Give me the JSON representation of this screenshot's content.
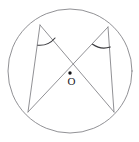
{
  "figure": {
    "type": "geometry-diagram",
    "canvas": {
      "width": 139,
      "height": 142,
      "background": "#ffffff"
    },
    "colors": {
      "line": "#7d7d82",
      "angle_arc": "#3a3a3e",
      "center_dot": "#111114",
      "label": "#1b1b1f"
    },
    "circle": {
      "name": "main-circle",
      "center": {
        "x": 70,
        "y": 71
      },
      "radius": 62,
      "stroke": "#7d7d82",
      "stroke_width": 0.85
    },
    "center_point": {
      "label": "O",
      "dot": {
        "x": 70,
        "y": 73,
        "r": 1.7
      },
      "label_position": {
        "x": 71.5,
        "y": 82
      }
    },
    "vertices": [
      {
        "id": "A",
        "role": "top-left",
        "x": 40,
        "y": 25
      },
      {
        "id": "B",
        "role": "top-right",
        "x": 108,
        "y": 27
      },
      {
        "id": "C",
        "role": "bottom-left",
        "x": 28,
        "y": 112
      },
      {
        "id": "D",
        "role": "bottom-right",
        "x": 114,
        "y": 112
      }
    ],
    "segments": [
      {
        "id": "A-D",
        "name": "chord-top-left-to-bottom-right",
        "from": "A",
        "to": "D"
      },
      {
        "id": "B-C",
        "name": "chord-top-right-to-bottom-left",
        "from": "B",
        "to": "C"
      },
      {
        "id": "A-C",
        "name": "chord-left-side",
        "from": "A",
        "to": "C"
      },
      {
        "id": "B-D",
        "name": "chord-right-side",
        "from": "B",
        "to": "D"
      }
    ],
    "angle_marks": [
      {
        "id": "angle-at-A",
        "name": "inscribed-angle-top-left",
        "vertex": "A",
        "between": [
          "A-C",
          "A-D"
        ],
        "radius": 20,
        "path": "M 37.8 45.2 A 20 20 0 0 0 55.0 38.0"
      },
      {
        "id": "angle-at-B",
        "name": "inscribed-angle-top-right",
        "vertex": "B",
        "between": [
          "B-D",
          "B-C"
        ],
        "radius": 20,
        "path": "M 92.6 44.3 A 20 20 0 0 0 110.3 47.0"
      }
    ]
  }
}
